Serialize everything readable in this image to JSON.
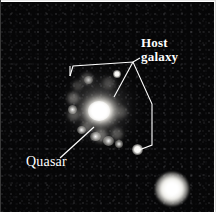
{
  "figure": {
    "name": "quasar-host-galaxy-astronomical-image",
    "background_color": "#060607",
    "annotation_color": "#ffffff",
    "width": 216,
    "height": 220
  },
  "labels": {
    "host_galaxy": {
      "line1": "Host",
      "line2": "galaxy",
      "text": "Host galaxy",
      "color": "#ffffff",
      "x": 141,
      "y": 36
    },
    "quasar": {
      "text": "Quasar",
      "color": "#ffffff",
      "x": 26,
      "y": 155
    }
  },
  "annotations": {
    "host_galaxy_outline": {
      "name": "host-galaxy-boundary-polyline",
      "points": "70,76 73,66 133,62 152,104 152,145 139,150",
      "tick_start": "70,76 70,66",
      "stroke": "#ffffff",
      "stroke_width": 1.1
    },
    "host_galaxy_leader": {
      "name": "host-galaxy-leader-line",
      "points": "141,57 133,62",
      "stroke": "#ffffff"
    },
    "host_galaxy_pointer": {
      "name": "host-galaxy-pointer-to-core",
      "points": "133,62 115,96",
      "stroke": "#ffffff"
    },
    "quasar_leader": {
      "name": "quasar-leader-line",
      "points": "60,158 94,127",
      "stroke": "#ffffff"
    }
  },
  "objects": {
    "galaxy": {
      "name": "host-galaxy-nebulosity",
      "center_x": 100,
      "center_y": 108,
      "description": "diffuse spiral host galaxy with bright quasar nucleus"
    },
    "quasar_nucleus": {
      "name": "quasar-bright-core",
      "center_x": 99,
      "center_y": 109
    },
    "point_sources": [
      {
        "name": "point-source-upper",
        "x": 118,
        "y": 73,
        "radius": 2.6,
        "kind": "small"
      },
      {
        "name": "point-source-lower",
        "x": 138,
        "y": 148,
        "radius": 3.4,
        "kind": "small"
      },
      {
        "name": "foreground-star-lower-right",
        "x": 173,
        "y": 188,
        "radius": 13,
        "kind": "bright"
      }
    ],
    "knots": [
      {
        "name": "galaxy-knot-a",
        "x": 96,
        "y": 136,
        "r": 4
      },
      {
        "name": "galaxy-knot-b",
        "x": 108,
        "y": 140,
        "r": 4
      },
      {
        "name": "galaxy-knot-c",
        "x": 119,
        "y": 143,
        "r": 3
      },
      {
        "name": "galaxy-knot-d",
        "x": 82,
        "y": 129,
        "r": 3
      },
      {
        "name": "galaxy-knot-e",
        "x": 73,
        "y": 108,
        "r": 3
      }
    ]
  }
}
